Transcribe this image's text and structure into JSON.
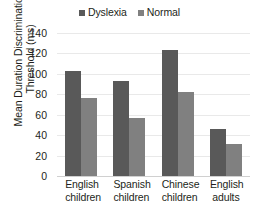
{
  "chart_data": {
    "type": "bar",
    "title": "",
    "xlabel": "",
    "ylabel_lines": [
      "Mean Duration Discrimination",
      "Threshold (ms)"
    ],
    "ylabel": "Mean Duration Discrimination Threshold (ms)",
    "categories": [
      "English children",
      "Spanish children",
      "Chinese children",
      "English adults"
    ],
    "category_lines": [
      [
        "English",
        "children"
      ],
      [
        "Spanish",
        "children"
      ],
      [
        "Chinese",
        "children"
      ],
      [
        "English",
        "adults"
      ]
    ],
    "series": [
      {
        "name": "Dyslexia",
        "color": "#595959",
        "values": [
          103,
          93,
          123,
          46
        ]
      },
      {
        "name": "Normal",
        "color": "#808080",
        "values": [
          76,
          57,
          82,
          31
        ]
      }
    ],
    "ylim": [
      0,
      140
    ],
    "yticks": [
      0,
      20,
      40,
      60,
      80,
      100,
      120,
      140
    ],
    "ytick_labels": [
      "0",
      "20",
      "40",
      "60",
      "80",
      "100",
      "120",
      "140"
    ],
    "grid": "horizontal",
    "legend_position": "top-center"
  }
}
